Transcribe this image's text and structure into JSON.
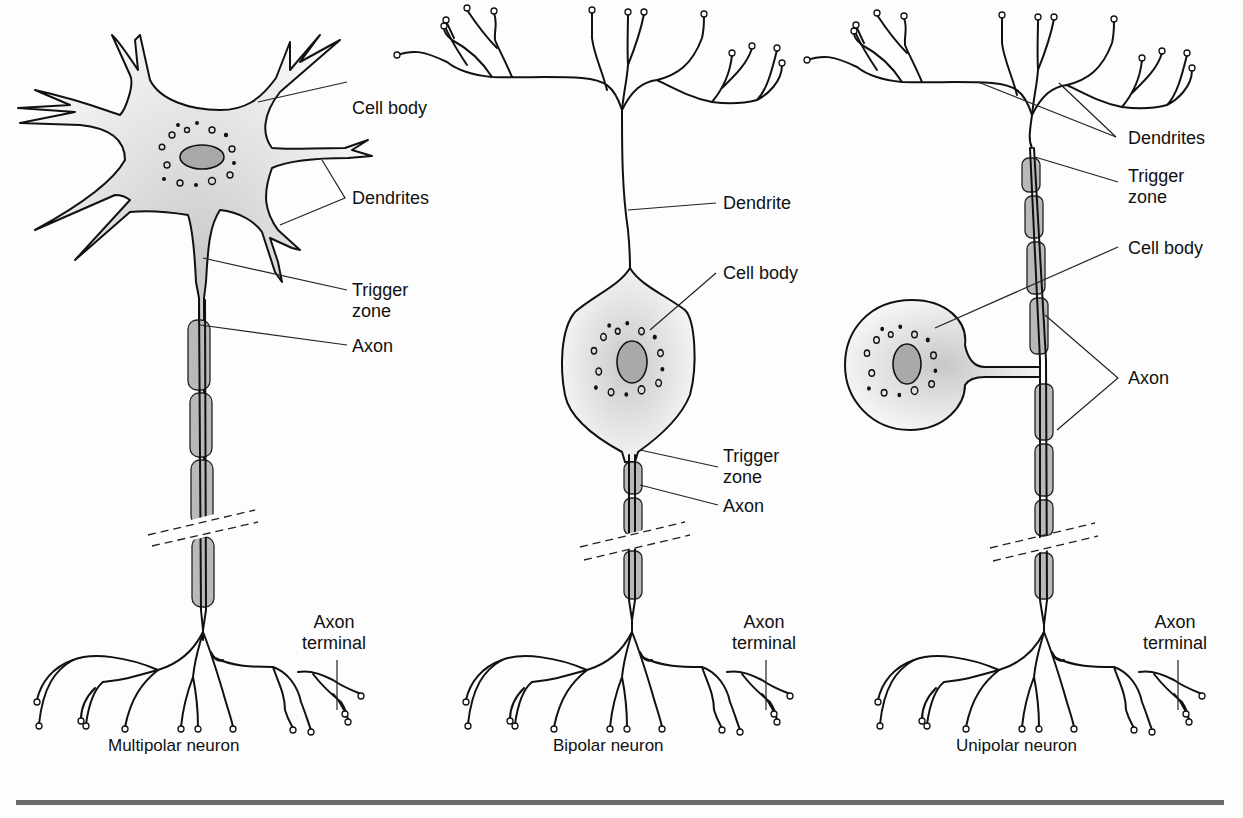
{
  "figure": {
    "colors": {
      "line": "#111111",
      "myelin": "#b9b9b9",
      "nucleus": "#a9a9a9",
      "cell_shading": "#d8d8d8",
      "rule": "#6a6a6a",
      "background": "#fdfdfd"
    }
  },
  "neurons": [
    {
      "id": "multipolar",
      "caption": "Multipolar neuron",
      "labels": {
        "cell_body": "Cell body",
        "dendrites": "Dendrites",
        "trigger_zone": "Trigger\nzone",
        "axon": "Axon",
        "axon_terminal": "Axon\nterminal"
      }
    },
    {
      "id": "bipolar",
      "caption": "Bipolar neuron",
      "labels": {
        "dendrite": "Dendrite",
        "cell_body": "Cell body",
        "trigger_zone": "Trigger\nzone",
        "axon": "Axon",
        "axon_terminal": "Axon\nterminal"
      }
    },
    {
      "id": "unipolar",
      "caption": "Unipolar neuron",
      "labels": {
        "dendrites": "Dendrites",
        "trigger_zone": "Trigger\nzone",
        "cell_body": "Cell body",
        "axon": "Axon",
        "axon_terminal": "Axon\nterminal"
      }
    }
  ]
}
